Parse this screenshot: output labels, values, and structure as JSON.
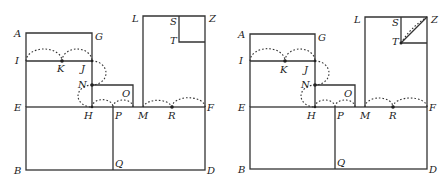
{
  "figure": {
    "panels": [
      {
        "id": "left",
        "labels": {
          "A": "A",
          "G": "G",
          "I": "I",
          "K": "K",
          "J": "J",
          "N": "N",
          "O": "O",
          "E": "E",
          "H": "H",
          "P": "P",
          "M": "M",
          "R": "R",
          "F": "F",
          "B": "B",
          "Q": "Q",
          "D": "D",
          "L": "L",
          "S": "S",
          "T": "T",
          "Z": "Z"
        },
        "has_diagonal_TZ": false
      },
      {
        "id": "right",
        "labels": {
          "A": "A",
          "G": "G",
          "I": "I",
          "K": "K",
          "J": "J",
          "N": "N",
          "O": "O",
          "E": "E",
          "H": "H",
          "P": "P",
          "M": "M",
          "R": "R",
          "F": "F",
          "B": "B",
          "Q": "Q",
          "D": "D",
          "L": "L",
          "S": "S",
          "T": "T",
          "Z": "Z"
        },
        "has_diagonal_TZ": true
      }
    ],
    "colors": {
      "line": "#333333",
      "text": "#222222",
      "background": "#ffffff"
    }
  }
}
